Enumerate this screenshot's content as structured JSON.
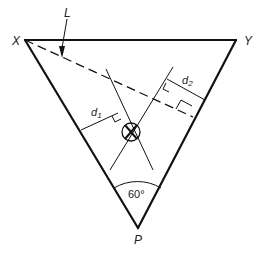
{
  "diagram": {
    "vertices": {
      "X": {
        "label": "X",
        "x": 25,
        "y": 40
      },
      "Y": {
        "label": "Y",
        "x": 236,
        "y": 40
      },
      "P": {
        "label": "P",
        "x": 138,
        "y": 228
      }
    },
    "line_label": "L",
    "distance_labels": {
      "d1": "d",
      "d1_sub": "1",
      "d2": "d",
      "d2_sub": "2"
    },
    "angle_label": "60°",
    "colors": {
      "stroke": "#111111",
      "background": "#ffffff"
    }
  }
}
